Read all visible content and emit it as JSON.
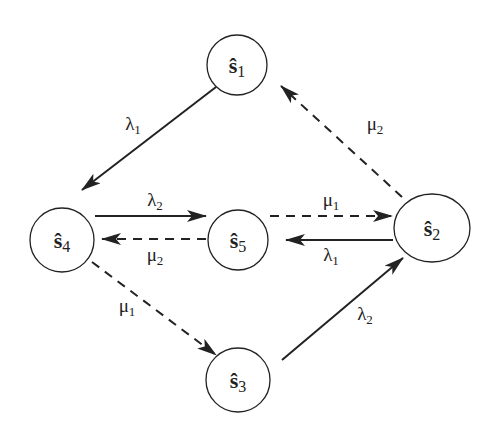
{
  "diagram": {
    "type": "state-transition",
    "nodes": [
      {
        "id": "s1",
        "symbol": "ŝ",
        "index": "1"
      },
      {
        "id": "s2",
        "symbol": "ŝ",
        "index": "2"
      },
      {
        "id": "s3",
        "symbol": "ŝ",
        "index": "3"
      },
      {
        "id": "s4",
        "symbol": "ŝ",
        "index": "4"
      },
      {
        "id": "s5",
        "symbol": "ŝ",
        "index": "5"
      }
    ],
    "edges": [
      {
        "from": "s1",
        "to": "s4",
        "label_symbol": "λ",
        "label_index": "1",
        "style": "solid"
      },
      {
        "from": "s2",
        "to": "s1",
        "label_symbol": "μ",
        "label_index": "2",
        "style": "dashed"
      },
      {
        "from": "s4",
        "to": "s5",
        "label_symbol": "λ",
        "label_index": "2",
        "style": "solid"
      },
      {
        "from": "s5",
        "to": "s4",
        "label_symbol": "μ",
        "label_index": "2",
        "style": "dashed"
      },
      {
        "from": "s5",
        "to": "s2",
        "label_symbol": "μ",
        "label_index": "1",
        "style": "dashed"
      },
      {
        "from": "s2",
        "to": "s5",
        "label_symbol": "λ",
        "label_index": "1",
        "style": "solid"
      },
      {
        "from": "s4",
        "to": "s3",
        "label_symbol": "μ",
        "label_index": "1",
        "style": "dashed"
      },
      {
        "from": "s3",
        "to": "s2",
        "label_symbol": "λ",
        "label_index": "2",
        "style": "solid"
      }
    ]
  }
}
